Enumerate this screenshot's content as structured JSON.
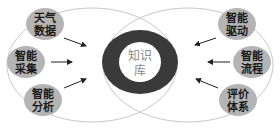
{
  "diagram": {
    "center": {
      "label_line1": "知识",
      "label_line2": "库"
    },
    "left_nodes": [
      {
        "line1": "天气",
        "line2": "数据"
      },
      {
        "line1": "智能",
        "line2": "采集"
      },
      {
        "line1": "智能",
        "line2": "分析"
      }
    ],
    "right_nodes": [
      {
        "line1": "智能",
        "line2": "驱动"
      },
      {
        "line1": "智能",
        "line2": "流程"
      },
      {
        "line1": "评价",
        "line2": "体系"
      }
    ],
    "colors": {
      "node_fill": "#b4b4b4",
      "ring": "#3a3a3a",
      "outline": "#c8c8c8",
      "arrow": "#222222"
    }
  }
}
